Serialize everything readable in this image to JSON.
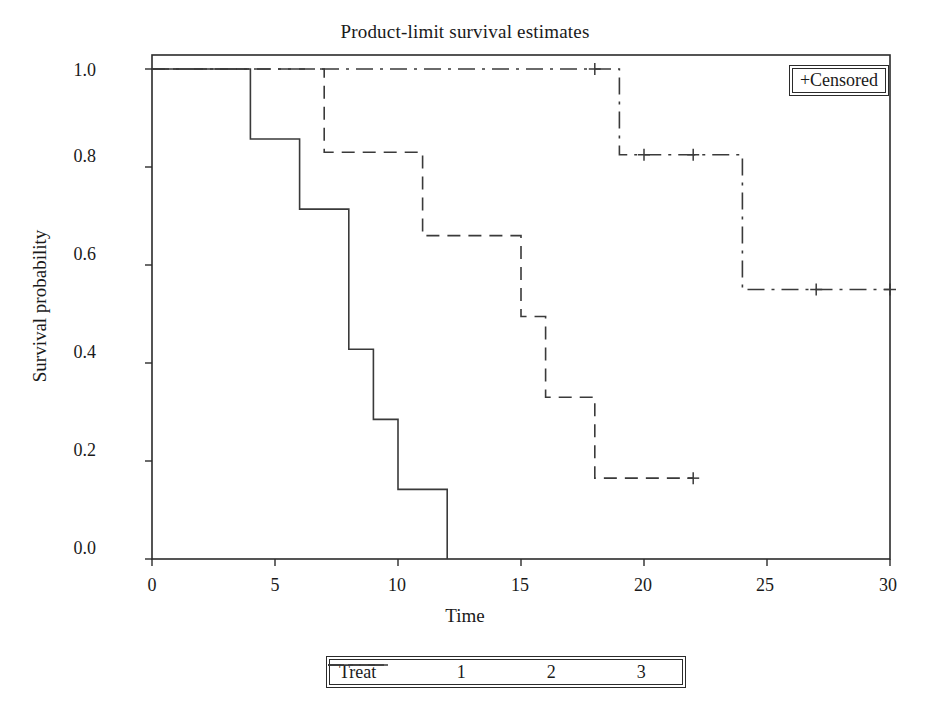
{
  "title": "Product-limit survival estimates",
  "axes": {
    "xlabel": "Time",
    "ylabel": "Survival probability",
    "xticks": [
      "0",
      "5",
      "10",
      "15",
      "20",
      "25",
      "30"
    ],
    "yticks": [
      "1.0",
      "0.8",
      "0.6",
      "0.4",
      "0.2",
      "0.0"
    ],
    "xlim": [
      0,
      30
    ],
    "ylim": [
      0,
      1
    ]
  },
  "censored_legend": {
    "label": "+Censored",
    "marker": "plus"
  },
  "legend": {
    "title": "Treat",
    "entries": [
      {
        "label": "1",
        "style": "solid"
      },
      {
        "label": "2",
        "style": "dashed"
      },
      {
        "label": "3",
        "style": "dash-dot"
      }
    ]
  },
  "colors": {
    "line": "#3a3a3a",
    "axis": "#2b2b2b",
    "background": "#ffffff"
  },
  "chart_data": {
    "type": "line",
    "title": "Product-limit survival estimates",
    "xlabel": "Time",
    "ylabel": "Survival probability",
    "xlim": [
      0,
      30
    ],
    "ylim": [
      0,
      1
    ],
    "grid": false,
    "legend_position": "bottom",
    "step": "post",
    "series": [
      {
        "name": "1",
        "style": "solid",
        "points": [
          {
            "x": 0,
            "y": 1.0
          },
          {
            "x": 4,
            "y": 0.857
          },
          {
            "x": 6,
            "y": 0.714
          },
          {
            "x": 8,
            "y": 0.428
          },
          {
            "x": 9,
            "y": 0.285
          },
          {
            "x": 10,
            "y": 0.142
          },
          {
            "x": 12,
            "y": 0.0
          }
        ],
        "censored": []
      },
      {
        "name": "2",
        "style": "dashed",
        "points": [
          {
            "x": 0,
            "y": 1.0
          },
          {
            "x": 7,
            "y": 0.83
          },
          {
            "x": 11,
            "y": 0.66
          },
          {
            "x": 15,
            "y": 0.495
          },
          {
            "x": 16,
            "y": 0.33
          },
          {
            "x": 18,
            "y": 0.165
          }
        ],
        "censored": [
          {
            "x": 22,
            "y": 0.165
          }
        ],
        "end_x": 22
      },
      {
        "name": "3",
        "style": "dash-dot",
        "points": [
          {
            "x": 0,
            "y": 1.0
          },
          {
            "x": 19,
            "y": 0.825
          },
          {
            "x": 24,
            "y": 0.55
          }
        ],
        "censored": [
          {
            "x": 18,
            "y": 1.0
          },
          {
            "x": 20,
            "y": 0.825
          },
          {
            "x": 22,
            "y": 0.825
          },
          {
            "x": 27,
            "y": 0.55
          },
          {
            "x": 30,
            "y": 0.55
          }
        ],
        "end_x": 30
      }
    ]
  }
}
